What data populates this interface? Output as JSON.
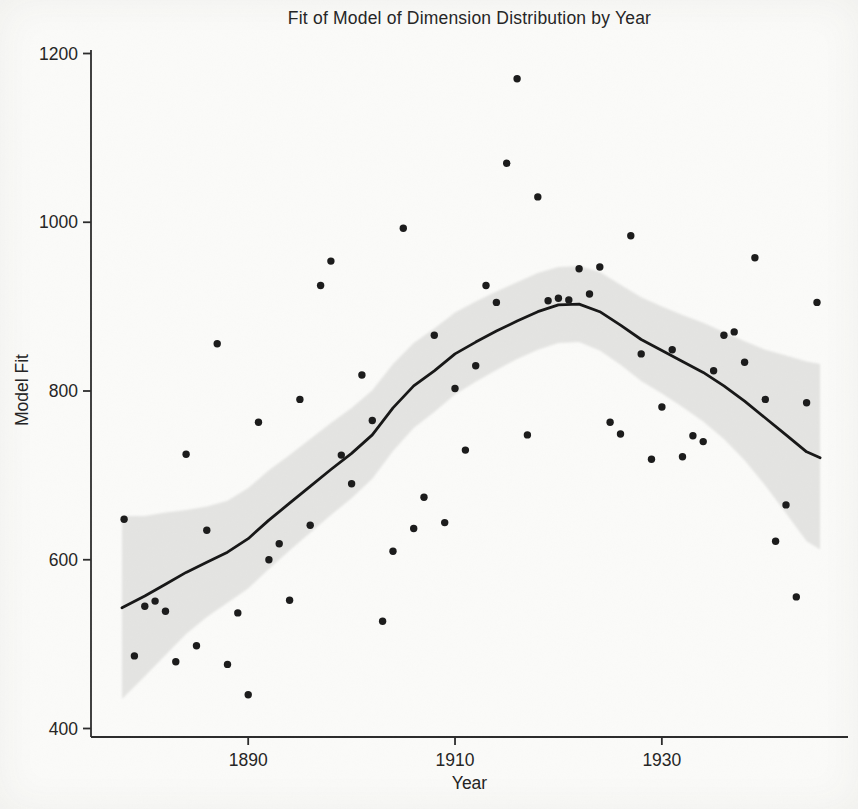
{
  "figure": {
    "title": "Fit of Model of Dimension Distribution by Year",
    "xlabel": "Year",
    "ylabel": "Model Fit"
  },
  "chart_data": {
    "type": "scatter",
    "title": "Fit of Model of Dimension Distribution by Year",
    "xlabel": "Year",
    "ylabel": "Model Fit",
    "xlim": [
      1874.8,
      1948
    ],
    "ylim": [
      400,
      1200
    ],
    "x_ticks": [
      1890,
      1910,
      1930
    ],
    "y_ticks": [
      400,
      600,
      800,
      1000,
      1200
    ],
    "grid": false,
    "legend": "none",
    "colors": {
      "point": "#1a1a1a",
      "line": "#161616",
      "band": "#e4e4e2",
      "axis": "#2b2b2b",
      "background": "#fbfbf9"
    },
    "series": [
      {
        "name": "observations",
        "type": "scatter",
        "points": [
          [
            1878,
            648
          ],
          [
            1879,
            486
          ],
          [
            1880,
            545
          ],
          [
            1881,
            551
          ],
          [
            1882,
            539
          ],
          [
            1883,
            479
          ],
          [
            1884,
            725
          ],
          [
            1885,
            498
          ],
          [
            1886,
            635
          ],
          [
            1887,
            856
          ],
          [
            1888,
            476
          ],
          [
            1889,
            537
          ],
          [
            1890,
            440
          ],
          [
            1891,
            763
          ],
          [
            1892,
            600
          ],
          [
            1893,
            619
          ],
          [
            1894,
            552
          ],
          [
            1895,
            790
          ],
          [
            1896,
            641
          ],
          [
            1897,
            925
          ],
          [
            1898,
            954
          ],
          [
            1899,
            724
          ],
          [
            1900,
            690
          ],
          [
            1901,
            819
          ],
          [
            1902,
            765
          ],
          [
            1903,
            527
          ],
          [
            1904,
            610
          ],
          [
            1905,
            993
          ],
          [
            1906,
            637
          ],
          [
            1907,
            674
          ],
          [
            1908,
            866
          ],
          [
            1909,
            644
          ],
          [
            1910,
            803
          ],
          [
            1911,
            730
          ],
          [
            1912,
            830
          ],
          [
            1913,
            925
          ],
          [
            1914,
            905
          ],
          [
            1915,
            1070
          ],
          [
            1916,
            1170
          ],
          [
            1917,
            748
          ],
          [
            1918,
            1030
          ],
          [
            1919,
            907
          ],
          [
            1920,
            910
          ],
          [
            1921,
            908
          ],
          [
            1922,
            945
          ],
          [
            1923,
            915
          ],
          [
            1924,
            947
          ],
          [
            1925,
            763
          ],
          [
            1926,
            749
          ],
          [
            1927,
            984
          ],
          [
            1928,
            844
          ],
          [
            1929,
            719
          ],
          [
            1930,
            781
          ],
          [
            1931,
            849
          ],
          [
            1932,
            722
          ],
          [
            1933,
            747
          ],
          [
            1934,
            740
          ],
          [
            1935,
            824
          ],
          [
            1936,
            866
          ],
          [
            1937,
            870
          ],
          [
            1938,
            834
          ],
          [
            1939,
            958
          ],
          [
            1940,
            790
          ],
          [
            1941,
            622
          ],
          [
            1942,
            665
          ],
          [
            1943,
            556
          ],
          [
            1944,
            786
          ],
          [
            1945,
            905
          ]
        ]
      },
      {
        "name": "loess-fit-with-confidence-band",
        "type": "area",
        "smooth": [
          [
            1877.8,
            543,
            435,
            652
          ],
          [
            1880,
            557,
            462,
            652
          ],
          [
            1882,
            571,
            487,
            656
          ],
          [
            1884,
            585,
            512,
            659
          ],
          [
            1886,
            597,
            532,
            663
          ],
          [
            1888,
            609,
            549,
            670
          ],
          [
            1890,
            625,
            566,
            685
          ],
          [
            1892,
            647,
            589,
            706
          ],
          [
            1894,
            667,
            611,
            724
          ],
          [
            1896,
            687,
            632,
            743
          ],
          [
            1898,
            707,
            653,
            762
          ],
          [
            1900,
            726,
            673,
            780
          ],
          [
            1902,
            748,
            696,
            801
          ],
          [
            1904,
            780,
            729,
            832
          ],
          [
            1906,
            806,
            756,
            857
          ],
          [
            1908,
            824,
            775,
            874
          ],
          [
            1910,
            844,
            796,
            893
          ],
          [
            1912,
            858,
            811,
            906
          ],
          [
            1914,
            871,
            825,
            918
          ],
          [
            1916,
            883,
            838,
            929
          ],
          [
            1918,
            894,
            849,
            940
          ],
          [
            1920,
            902,
            857,
            947
          ],
          [
            1922,
            903,
            858,
            948
          ],
          [
            1924,
            894,
            848,
            941
          ],
          [
            1926,
            878,
            831,
            926
          ],
          [
            1928,
            861,
            812,
            911
          ],
          [
            1930,
            848,
            797,
            900
          ],
          [
            1932,
            835,
            781,
            890
          ],
          [
            1934,
            822,
            764,
            881
          ],
          [
            1936,
            806,
            743,
            870
          ],
          [
            1938,
            788,
            718,
            859
          ],
          [
            1940,
            768,
            688,
            849
          ],
          [
            1942,
            748,
            655,
            842
          ],
          [
            1944,
            728,
            622,
            835
          ],
          [
            1945.3,
            721,
            612,
            832
          ]
        ]
      }
    ]
  }
}
